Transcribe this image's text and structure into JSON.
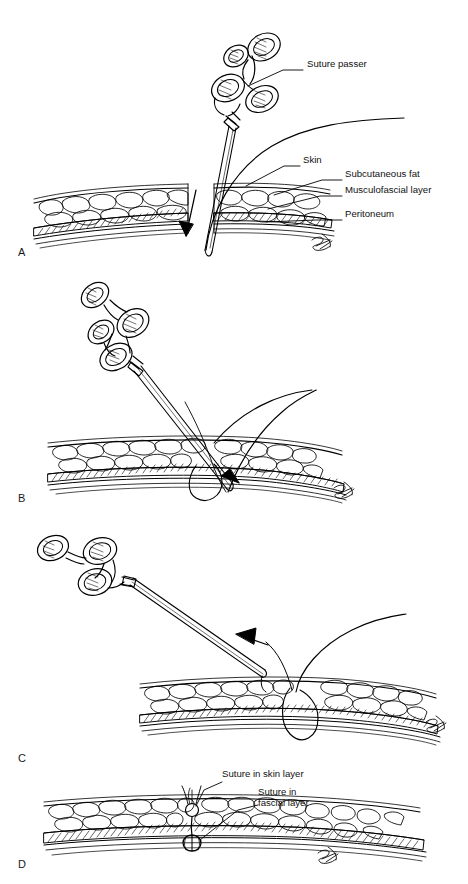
{
  "figure": {
    "type": "medical-illustration",
    "background_color": "#ffffff",
    "ink_color": "#000000",
    "panel_count": 4
  },
  "panels": [
    {
      "letter": "A",
      "letter_x": 18,
      "letter_y": 252,
      "description": "Suture passer with suture inserted vertically through abdominal wall layers on one side of the port site",
      "callouts": [
        {
          "text": "Suture passer",
          "x": 307,
          "y": 64,
          "leader": [
            [
              303,
              70
            ],
            [
              283,
              70
            ],
            [
              239,
              88
            ]
          ]
        },
        {
          "text": "Skin",
          "x": 303,
          "y": 160,
          "leader": [
            [
              300,
              166
            ],
            [
              282,
              166
            ],
            [
              243,
              188
            ]
          ]
        },
        {
          "text": "Subcutaneous fat",
          "x": 345,
          "y": 174,
          "leader": [
            [
              342,
              180
            ],
            [
              320,
              180
            ],
            [
              272,
              196
            ]
          ]
        },
        {
          "text": "Musculofascial layer",
          "x": 345,
          "y": 190,
          "leader": [
            [
              342,
              196
            ],
            [
              318,
              196
            ],
            [
              268,
              208
            ]
          ]
        },
        {
          "text": "Peritoneum",
          "x": 345,
          "y": 214,
          "leader": [
            [
              342,
              220
            ],
            [
              316,
              220
            ],
            [
              262,
              221
            ]
          ]
        }
      ]
    },
    {
      "letter": "B",
      "letter_x": 18,
      "letter_y": 492,
      "description": "Suture passer reinserted at an oblique angle on the opposite side to grasp the free suture end; arrow indicates direction",
      "callouts": []
    },
    {
      "letter": "C",
      "letter_x": 18,
      "letter_y": 758,
      "description": "Suture passer withdrawn upward carrying the suture end back through the fascia; arrow indicates withdrawal direction",
      "callouts": []
    },
    {
      "letter": "D",
      "letter_x": 18,
      "letter_y": 866,
      "description": "Completed closure showing knots tied in the fascial layer and in the skin layer",
      "callouts": [
        {
          "text": "Suture in skin layer",
          "x": 222,
          "y": 770,
          "leader": [
            [
              220,
              776
            ],
            [
              200,
              783
            ],
            [
              196,
              806
            ]
          ]
        },
        {
          "text": "Suture in",
          "x": 258,
          "y": 790,
          "leader": []
        },
        {
          "text": "fascial layer",
          "x": 258,
          "y": 801,
          "leader": [
            [
              256,
              803
            ],
            [
              232,
              810
            ],
            [
              200,
              843
            ]
          ]
        }
      ]
    }
  ],
  "tissue_layers": [
    {
      "name": "Skin",
      "style": "thin double line, top surface"
    },
    {
      "name": "Subcutaneous fat",
      "style": "lobular bubbly fat globules"
    },
    {
      "name": "Musculofascial layer",
      "style": "dense diagonal cross-hatch band"
    },
    {
      "name": "Peritoneum",
      "style": "thin line, lowest layer"
    }
  ],
  "instrument": {
    "name": "Suture passer",
    "handle": "four-ring cross-hatched scissor-style handle",
    "shaft": "long slender double-line shaft with pointed tip"
  },
  "annotations": {
    "artist_signature": "SP monogram",
    "signature_positions": [
      {
        "x": 318,
        "y": 240
      },
      {
        "x": 340,
        "y": 492
      },
      {
        "x": 432,
        "y": 726
      },
      {
        "x": 330,
        "y": 862
      }
    ]
  }
}
